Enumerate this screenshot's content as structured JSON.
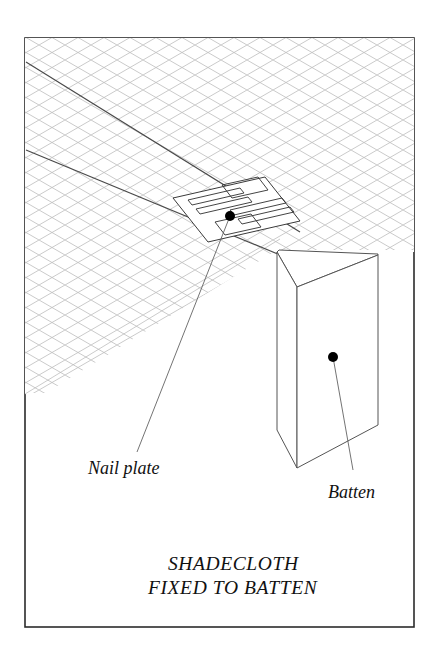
{
  "figure": {
    "background_color": "#ffffff",
    "frame": {
      "stroke_color": "#2b2b2b",
      "x": 25,
      "y": 38,
      "width": 389,
      "height": 589
    }
  },
  "labels": {
    "nail_plate": "Nail plate",
    "batten": "Batten"
  },
  "caption": {
    "line1": "SHADECLOTH",
    "line2": "FIXED TO BATTEN"
  },
  "components": {
    "shadecloth": {
      "name": "shadecloth",
      "mesh_color": "#b9b9b9",
      "mesh_spacing": 13,
      "description": "Diamond mesh fabric sheet in isometric view"
    },
    "batten": {
      "name": "batten",
      "stroke_color": "#555555",
      "description": "Rectangular timber batten shown in isometric projection"
    },
    "nail_plate": {
      "name": "nail-plate",
      "stroke_color": "#3a3a3a",
      "slot_count": 6,
      "description": "Toothed metal nail plate fastening cloth to batten"
    }
  },
  "leaders": {
    "nail_plate": {
      "dot_x": 230,
      "dot_y": 216,
      "end_x": 137,
      "end_y": 452
    },
    "batten": {
      "dot_x": 333,
      "dot_y": 357,
      "end_x": 353,
      "end_y": 470
    }
  }
}
